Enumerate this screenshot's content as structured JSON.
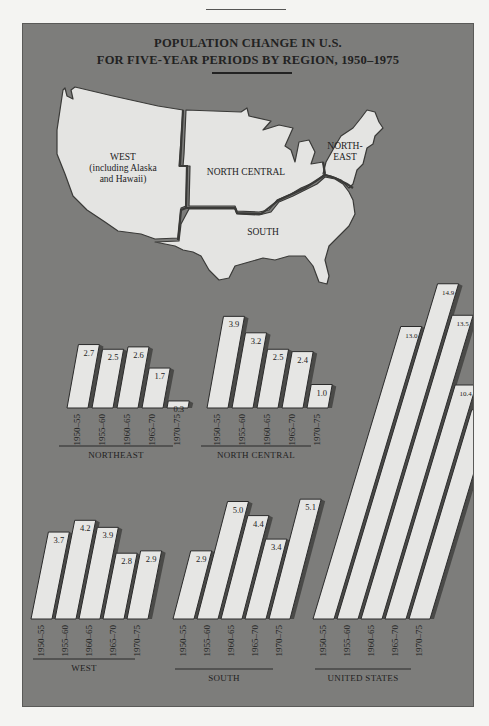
{
  "page": {
    "title_line1": "POPULATION CHANGE IN U.S.",
    "title_line2": "FOR FIVE-YEAR PERIODS BY REGION, 1950–1975"
  },
  "map": {
    "regions": [
      {
        "id": "west",
        "label_line1": "WEST",
        "label_line2": "(including Alaska",
        "label_line3": "and Hawaii)"
      },
      {
        "id": "north-central",
        "label_line1": "NORTH CENTRAL"
      },
      {
        "id": "northeast",
        "label_line1": "NORTH-",
        "label_line2": "EAST"
      },
      {
        "id": "south",
        "label_line1": "SOUTH"
      }
    ]
  },
  "colors": {
    "panel": "#7d7d7b",
    "bar_fill": "#e6e6e4",
    "bar_outline": "#2a2a2a",
    "bar_shadow": "#4a4a48",
    "text": "#222222"
  },
  "chart_data": [
    {
      "type": "bar",
      "title": "NORTHEAST",
      "categories": [
        "1950–55",
        "1955–60",
        "1960–65",
        "1965–70",
        "1970–75"
      ],
      "values": [
        2.7,
        2.5,
        2.6,
        1.7,
        0.3
      ],
      "value_labels": [
        "2.7",
        "2.5",
        "2.6",
        "1.7",
        "0.3"
      ],
      "xlabel": "NORTHEAST",
      "ylabel": "",
      "unit": "population change (five-year period)"
    },
    {
      "type": "bar",
      "title": "NORTH CENTRAL",
      "categories": [
        "1950–55",
        "1955–60",
        "1960–65",
        "1965–70",
        "1970–75"
      ],
      "values": [
        3.9,
        3.2,
        2.5,
        2.4,
        1.0
      ],
      "value_labels": [
        "3.9",
        "3.2",
        "2.5",
        "2.4",
        "1.0"
      ],
      "xlabel": "NORTH CENTRAL",
      "ylabel": ""
    },
    {
      "type": "bar",
      "title": "WEST",
      "categories": [
        "1950–55",
        "1955–60",
        "1960–65",
        "1965–70",
        "1970–75"
      ],
      "values": [
        3.7,
        4.2,
        3.9,
        2.8,
        2.9
      ],
      "value_labels": [
        "3.7",
        "4.2",
        "3.9",
        "2.8",
        "2.9"
      ],
      "xlabel": "WEST",
      "ylabel": ""
    },
    {
      "type": "bar",
      "title": "SOUTH",
      "categories": [
        "1950–55",
        "1955–60",
        "1960–65",
        "1965–70",
        "1970–75"
      ],
      "values": [
        2.9,
        5.0,
        4.4,
        3.4,
        5.1
      ],
      "value_labels": [
        "2.9",
        "5.0",
        "4.4",
        "3.4",
        "5.1"
      ],
      "xlabel": "SOUTH",
      "ylabel": ""
    },
    {
      "type": "bar",
      "title": "UNITED STATES",
      "categories": [
        "1950–55",
        "1955–60",
        "1960–65",
        "1965–70",
        "1970–75"
      ],
      "values": [
        13.0,
        14.9,
        13.5,
        10.4,
        9.3
      ],
      "value_labels": [
        "13.0",
        "14.9",
        "13.5",
        "10.4",
        "9.3"
      ],
      "xlabel": "UNITED STATES",
      "ylabel": ""
    }
  ]
}
